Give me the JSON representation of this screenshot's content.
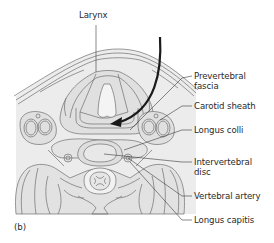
{
  "figure": {
    "panel_label": "(b)",
    "top_label": "Larynx",
    "labels": [
      {
        "id": "prevertebral-fascia",
        "line1": "Prevertebral",
        "line2": "fascia"
      },
      {
        "id": "carotid-sheath",
        "line1": "Carotid sheath",
        "line2": ""
      },
      {
        "id": "longus-colli",
        "line1": "Longus colli",
        "line2": ""
      },
      {
        "id": "intervertebral-disc",
        "line1": "Intervertebral",
        "line2": "disc"
      },
      {
        "id": "vertebral-artery",
        "line1": "Vertebral artery",
        "line2": ""
      },
      {
        "id": "longus-capitis",
        "line1": "Longus capitis",
        "line2": ""
      }
    ],
    "colors": {
      "tissue_fill": "#e6e6e6",
      "outline": "#6e6e6e",
      "leader_line": "#3a3a3a",
      "arrow": "#1a1a1a"
    }
  }
}
